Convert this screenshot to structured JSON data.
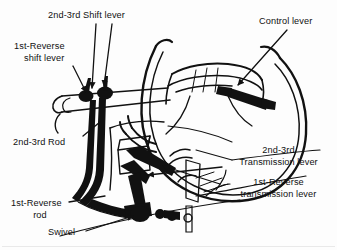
{
  "figure": {
    "kind": "technical-line-diagram",
    "background_color": "#fdfdfd",
    "ink_color": "#111111",
    "width": 337,
    "height": 250
  },
  "labels": [
    {
      "id": "second-third-shift-lever",
      "lines": [
        "2nd-3rd Shift lever"
      ],
      "x": 48,
      "y": 10,
      "align": "left",
      "leaders": [
        {
          "from": [
            96,
            24
          ],
          "to": [
            92,
            88
          ],
          "arrow": true
        },
        {
          "from": [
            112,
            24
          ],
          "to": [
            104,
            86
          ],
          "arrow": true
        }
      ]
    },
    {
      "id": "first-reverse-shift-lever",
      "lines": [
        "1st-Reverse",
        "shift lever"
      ],
      "x": 14,
      "y": 41,
      "align": "left",
      "leaders": [
        {
          "from": [
            73,
            66
          ],
          "to": [
            86,
            92
          ],
          "arrow": true
        }
      ]
    },
    {
      "id": "control-lever",
      "lines": [
        "Control lever"
      ],
      "x": 259,
      "y": 16,
      "align": "left",
      "leaders": [
        {
          "from": [
            287,
            30
          ],
          "to": [
            238,
            85
          ],
          "arrow": true
        }
      ]
    },
    {
      "id": "second-third-rod",
      "lines": [
        "2nd-3rd Rod"
      ],
      "x": 13,
      "y": 137,
      "align": "left",
      "leaders": [
        {
          "from": [
            83,
            136
          ],
          "to": [
            100,
            122
          ],
          "arrow": false
        }
      ]
    },
    {
      "id": "second-third-transmission-lever",
      "lines": [
        "2nd-3rd",
        "Transmission lever"
      ],
      "x": 251,
      "y": 145,
      "align": "center",
      "leaders": [
        {
          "from": [
            222,
            167
          ],
          "to": [
            148,
            175
          ],
          "arrow": true
        }
      ]
    },
    {
      "id": "first-reverse-transmission-lever",
      "lines": [
        "1st-Reverse",
        "transmission lever"
      ],
      "x": 249,
      "y": 177,
      "align": "center",
      "leaders": [
        {
          "from": [
            220,
            184
          ],
          "to": [
            163,
            166
          ],
          "arrow": true
        }
      ]
    },
    {
      "id": "first-reverse-rod",
      "lines": [
        "1st-Reverse",
        "rod"
      ],
      "x": 11,
      "y": 198,
      "align": "left",
      "leaders": [
        {
          "from": [
            69,
            202
          ],
          "to": [
            105,
            196
          ],
          "arrow": false
        }
      ]
    },
    {
      "id": "swivel",
      "lines": [
        "Swivel"
      ],
      "x": 48,
      "y": 227,
      "align": "left",
      "leaders": [
        {
          "from": [
            86,
            231
          ],
          "to": [
            133,
            216
          ],
          "arrow": true
        }
      ]
    }
  ]
}
